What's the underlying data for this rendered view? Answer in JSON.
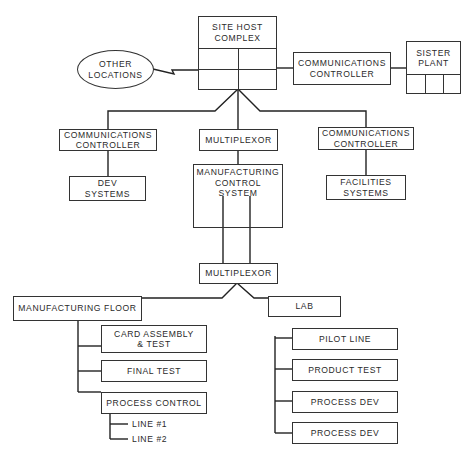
{
  "diagram": {
    "site_host": {
      "line1": "SITE HOST",
      "line2": "COMPLEX"
    },
    "other_locations": {
      "line1": "OTHER",
      "line2": "LOCATIONS"
    },
    "comm_controller_top": {
      "line1": "COMMUNICATIONS",
      "line2": "CONTROLLER"
    },
    "sister_plant": {
      "line1": "SISTER",
      "line2": "PLANT"
    },
    "comm_controller_left": {
      "line1": "COMMUNICATIONS",
      "line2": "CONTROLLER"
    },
    "multiplexor_top": {
      "label": "MULTIPLEXOR"
    },
    "comm_controller_right": {
      "line1": "COMMUNICATIONS",
      "line2": "CONTROLLER"
    },
    "dev_systems": {
      "line1": "DEV",
      "line2": "SYSTEMS"
    },
    "mcs": {
      "line1": "MANUFACTURING",
      "line2": "CONTROL",
      "line3": "SYSTEM"
    },
    "facilities_systems": {
      "line1": "FACILITIES",
      "line2": "SYSTEMS"
    },
    "multiplexor_bottom": {
      "label": "MULTIPLEXOR"
    },
    "manufacturing_floor": {
      "label": "MANUFACTURING FLOOR",
      "children": [
        {
          "line1": "CARD ASSEMBLY",
          "line2": "& TEST"
        },
        {
          "label": "FINAL TEST"
        },
        {
          "label": "PROCESS CONTROL"
        }
      ],
      "lines": [
        "LINE #1",
        "LINE #2"
      ]
    },
    "lab": {
      "label": "LAB",
      "children": [
        "PILOT LINE",
        "PRODUCT TEST",
        "PROCESS DEV",
        "PROCESS DEV"
      ]
    }
  }
}
